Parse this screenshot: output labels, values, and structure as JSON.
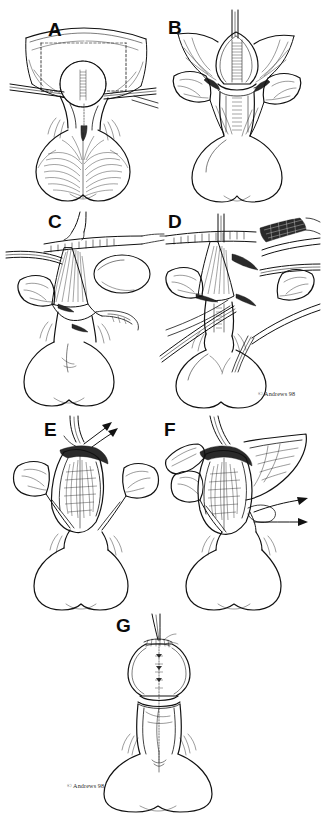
{
  "figure": {
    "background_color": "#ffffff",
    "ink_color": "#111111",
    "width": 322,
    "height": 814,
    "panel_count": 7,
    "layout": "two-column grid for panels A-F, single centered panel G at bottom"
  },
  "credits": [
    {
      "text": "© Andrews 98",
      "panel": "D"
    },
    {
      "text": "© Andrews 98",
      "panel": "G"
    }
  ],
  "panels": [
    {
      "id": "A",
      "label": "A",
      "row": 1,
      "column": "left",
      "caption": "Exposure with retracted flaps; dotted outline marks the planned incision area around a rounded central structure."
    },
    {
      "id": "B",
      "label": "B",
      "row": 1,
      "column": "right",
      "caption": "Central structure elevated and retracted, shaded band visible along its midline."
    },
    {
      "id": "C",
      "label": "C",
      "row": 2,
      "column": "left",
      "caption": "Instrument engaging the fan-shaped tissue bundle with an oval structure displaced laterally."
    },
    {
      "id": "D",
      "label": "D",
      "row": 2,
      "column": "right",
      "caption": "Multiple instruments and forceps converging on the dissection plane."
    },
    {
      "id": "E",
      "label": "E",
      "row": 3,
      "column": "left",
      "caption": "Opened cavity viewed from above with two divergent arrows indicating the direction of traction."
    },
    {
      "id": "F",
      "label": "F",
      "row": 3,
      "column": "right",
      "caption": "Lateral flap mobilized; two arrows indicate the direction of lateral displacement."
    },
    {
      "id": "G",
      "label": "G",
      "row": 4,
      "column": "center",
      "caption": "Completed closure with suture line shown in broken outline along the midline."
    }
  ],
  "annotations": {
    "arrow_count_panel_e": 2,
    "arrow_count_panel_f": 2,
    "dotted_outline_panel_a": "incision guide",
    "dashed_midline_panel_g": "suture line"
  }
}
